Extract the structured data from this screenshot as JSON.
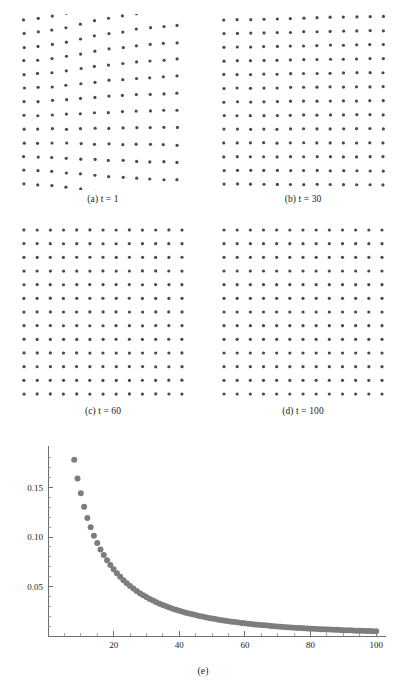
{
  "figure": {
    "panels": [
      {
        "id": "a",
        "label": "(a)",
        "var": "t",
        "eq": "=",
        "value": "1",
        "caption": "(a) t = 1"
      },
      {
        "id": "b",
        "label": "(b)",
        "var": "t",
        "eq": "=",
        "value": "30",
        "caption": "(b) t = 30"
      },
      {
        "id": "c",
        "label": "(c)",
        "var": "t",
        "eq": "=",
        "value": "60",
        "caption": "(c) t = 60"
      },
      {
        "id": "d",
        "label": "(d)",
        "var": "t",
        "eq": "=",
        "value": "100",
        "caption": "(d) t = 100"
      },
      {
        "id": "e",
        "label": "(e)",
        "caption": "(e)"
      }
    ],
    "dot_color": "#4a4a4a",
    "marker_color": "#7d7d7d",
    "axis_color": "#6f6f6f"
  },
  "lattices": {
    "rows": 13,
    "cols": 13,
    "dot_radius": 1.6,
    "panels": [
      {
        "id": "a",
        "t": 1,
        "disorder": 1.0,
        "seed": 17,
        "column_rise": [
          0.0,
          0.22,
          0.52,
          0.86,
          1.42,
          1.95,
          2.35,
          2.62,
          3.05,
          3.28,
          3.52,
          3.68,
          3.8
        ],
        "column_gap": [
          0.0,
          0.3,
          0.72,
          1.15,
          1.7,
          2.05,
          2.4,
          2.78,
          3.0,
          3.2,
          3.38,
          3.5,
          3.58
        ],
        "row_squeeze": [
          0.0,
          0.05,
          0.1,
          0.16,
          0.22,
          0.3,
          0.4,
          0.52,
          0.66,
          0.82,
          1.0,
          1.22,
          1.48
        ],
        "jitter": 0.55
      },
      {
        "id": "b",
        "t": 30,
        "disorder": 0.13,
        "seed": 43,
        "column_rise": [
          0.0,
          0.02,
          0.05,
          0.09,
          0.15,
          0.21,
          0.26,
          0.3,
          0.35,
          0.38,
          0.41,
          0.43,
          0.45
        ],
        "column_gap": [
          0.0,
          0.04,
          0.09,
          0.15,
          0.22,
          0.27,
          0.32,
          0.37,
          0.4,
          0.43,
          0.45,
          0.47,
          0.48
        ],
        "row_squeeze": [
          0.0,
          0.01,
          0.02,
          0.03,
          0.04,
          0.05,
          0.07,
          0.09,
          0.11,
          0.14,
          0.17,
          0.21,
          0.25
        ],
        "jitter": 0.3
      },
      {
        "id": "c",
        "t": 60,
        "disorder": 0.02,
        "seed": 71,
        "column_rise": [
          0,
          0,
          0,
          0,
          0,
          0,
          0,
          0,
          0,
          0,
          0,
          0,
          0
        ],
        "column_gap": [
          0,
          0,
          0,
          0,
          0,
          0,
          0,
          0,
          0,
          0,
          0,
          0,
          0
        ],
        "row_squeeze": [
          0,
          0,
          0,
          0,
          0,
          0,
          0,
          0,
          0,
          0,
          0,
          0,
          0
        ],
        "jitter": 0.14
      },
      {
        "id": "d",
        "t": 100,
        "disorder": 0.0,
        "seed": 95,
        "column_rise": [
          0,
          0,
          0,
          0,
          0,
          0,
          0,
          0,
          0,
          0,
          0,
          0,
          0
        ],
        "column_gap": [
          0,
          0,
          0,
          0,
          0,
          0,
          0,
          0,
          0,
          0,
          0,
          0,
          0
        ],
        "row_squeeze": [
          0,
          0,
          0,
          0,
          0,
          0,
          0,
          0,
          0,
          0,
          0,
          0,
          0
        ],
        "jitter": 0.03
      }
    ]
  },
  "chart_data": {
    "type": "scatter",
    "title": "",
    "subtitle": "",
    "xlabel": "",
    "ylabel": "",
    "xlim": [
      0,
      103
    ],
    "ylim": [
      0,
      0.192
    ],
    "grid": false,
    "legend": null,
    "marker_color": "#7d7d7d",
    "marker_size": 3.0,
    "x_ticks_major": [
      20,
      40,
      60,
      80,
      100
    ],
    "x_tick_labels": [
      "20",
      "40",
      "60",
      "80",
      "100"
    ],
    "x_ticks_minor": [
      5,
      10,
      15,
      25,
      30,
      35,
      45,
      50,
      55,
      65,
      70,
      75,
      85,
      90,
      95
    ],
    "y_ticks_major": [
      0.05,
      0.1,
      0.15
    ],
    "y_tick_labels": [
      "0.05",
      "0.10",
      "0.15"
    ],
    "y_ticks_minor": [
      0.01,
      0.02,
      0.03,
      0.04,
      0.06,
      0.07,
      0.08,
      0.09,
      0.11,
      0.12,
      0.13,
      0.14,
      0.16,
      0.17,
      0.18
    ],
    "x": [
      8,
      9,
      10,
      11,
      12,
      13,
      14,
      15,
      16,
      17,
      18,
      19,
      20,
      21,
      22,
      23,
      24,
      25,
      26,
      27,
      28,
      29,
      30,
      31,
      32,
      33,
      34,
      35,
      36,
      37,
      38,
      39,
      40,
      41,
      42,
      43,
      44,
      45,
      46,
      47,
      48,
      49,
      50,
      51,
      52,
      53,
      54,
      55,
      56,
      57,
      58,
      59,
      60,
      61,
      62,
      63,
      64,
      65,
      66,
      67,
      68,
      69,
      70,
      71,
      72,
      73,
      74,
      75,
      76,
      77,
      78,
      79,
      80,
      81,
      82,
      83,
      84,
      85,
      86,
      87,
      88,
      89,
      90,
      91,
      92,
      93,
      94,
      95,
      96,
      97,
      98,
      99,
      100
    ],
    "y": [
      0.178,
      0.1592,
      0.1442,
      0.1305,
      0.1192,
      0.11,
      0.1012,
      0.094,
      0.0875,
      0.0818,
      0.0765,
      0.0718,
      0.0674,
      0.0634,
      0.0598,
      0.0564,
      0.0533,
      0.0505,
      0.0479,
      0.0455,
      0.0433,
      0.0412,
      0.0393,
      0.0375,
      0.0358,
      0.0342,
      0.0327,
      0.0313,
      0.03,
      0.0288,
      0.0276,
      0.0265,
      0.0255,
      0.0245,
      0.0236,
      0.0227,
      0.0219,
      0.0211,
      0.0203,
      0.0196,
      0.0189,
      0.0183,
      0.0177,
      0.0171,
      0.0165,
      0.016,
      0.0155,
      0.015,
      0.0145,
      0.0141,
      0.0136,
      0.0132,
      0.0128,
      0.0125,
      0.0121,
      0.0117,
      0.0114,
      0.0111,
      0.0108,
      0.0105,
      0.0102,
      0.0099,
      0.0096,
      0.0094,
      0.0091,
      0.0089,
      0.0087,
      0.0084,
      0.0082,
      0.008,
      0.0078,
      0.0076,
      0.0074,
      0.0073,
      0.0071,
      0.0069,
      0.0068,
      0.0066,
      0.0065,
      0.0063,
      0.0062,
      0.006,
      0.0059,
      0.0058,
      0.0057,
      0.0055,
      0.0054,
      0.0053,
      0.0052,
      0.0051,
      0.005,
      0.0049,
      0.0048
    ]
  }
}
